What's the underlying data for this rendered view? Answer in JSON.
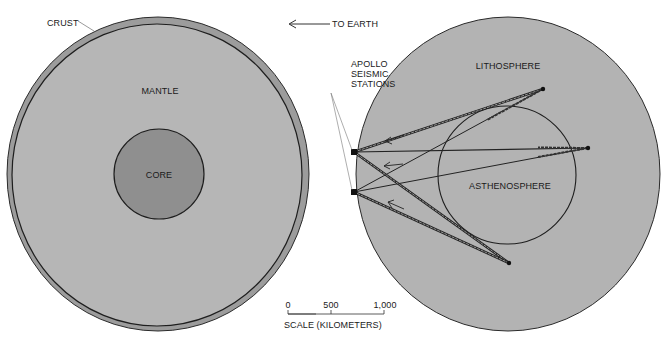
{
  "colors": {
    "background": "#ffffff",
    "crust": "#9a9a9a",
    "mantle": "#b5b5b5",
    "core": "#8e8e8e",
    "moon_body": "#b3b3b3",
    "outline": "#2a2a2a"
  },
  "left_diagram": {
    "crust_label": "CRUST",
    "mantle_label": "MANTLE",
    "core_label": "CORE"
  },
  "direction": {
    "arrow_icon": "left-arrow-icon",
    "label": "TO EARTH"
  },
  "right_diagram": {
    "stations_label_lines": [
      "APOLLO",
      "SEISMIC",
      "STATIONS"
    ],
    "lithosphere_label": "LITHOSPHERE",
    "asthenosphere_label": "ASTHENOSPHERE",
    "stations": [
      {
        "x": 354,
        "y": 152
      },
      {
        "x": 354,
        "y": 192
      }
    ],
    "sources": [
      {
        "x": 543,
        "y": 89
      },
      {
        "x": 588,
        "y": 148
      },
      {
        "x": 509,
        "y": 263
      }
    ]
  },
  "scale_bar": {
    "ticks": [
      "0",
      "500",
      "1,000"
    ],
    "label": "SCALE (KILOMETERS)"
  }
}
